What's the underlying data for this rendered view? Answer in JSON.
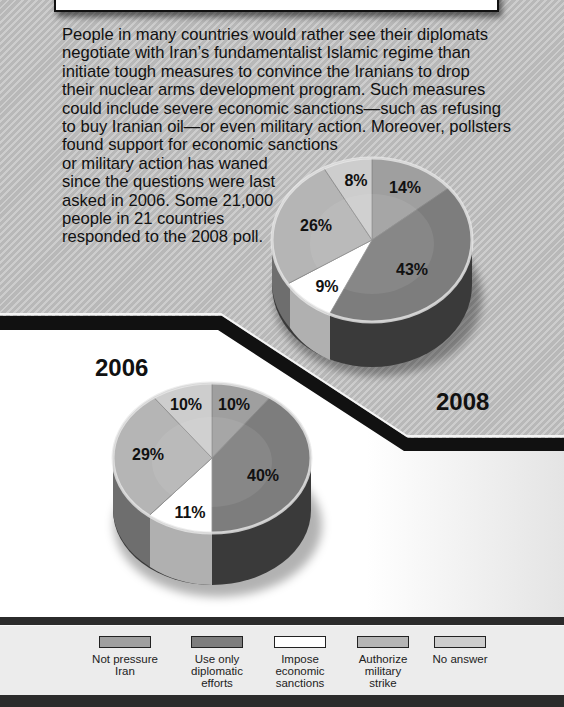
{
  "intro": {
    "lines": [
      "People in many countries would rather see their diplomats",
      "negotiate with Iran’s fundamentalist Islamic regime than",
      "initiate tough measures to convince the Iranians to drop",
      "their nuclear arms development program. Such measures",
      "could include severe economic sanctions—such as refusing",
      "to buy Iranian oil—or even military action. Moreover, pollsters",
      "found support for economic sanctions",
      "or military action has waned",
      "since the questions were last",
      "asked in 2006. Some 21,000",
      "people in 21 countries",
      "responded to the 2008 poll."
    ]
  },
  "years": {
    "y2006": "2006",
    "y2008": "2008"
  },
  "pie2008": {
    "labels": [
      "14%",
      "43%",
      "9%",
      "26%",
      "8%"
    ]
  },
  "pie2006": {
    "labels": [
      "10%",
      "40%",
      "11%",
      "29%",
      "10%"
    ]
  },
  "legend": {
    "items": [
      {
        "label_line1": "Not pressure",
        "label_line2": "Iran",
        "label_line3": "",
        "color": "#9f9f9f"
      },
      {
        "label_line1": "Use only",
        "label_line2": "diplomatic",
        "label_line3": "efforts",
        "color": "#7d7d7d"
      },
      {
        "label_line1": "Impose",
        "label_line2": "economic",
        "label_line3": "sanctions",
        "color": "#ffffff"
      },
      {
        "label_line1": "Authorize",
        "label_line2": "military",
        "label_line3": "strike",
        "color": "#b5b5b5"
      },
      {
        "label_line1": "No answer",
        "label_line2": "",
        "label_line3": "",
        "color": "#cdcdcd"
      }
    ]
  },
  "chart_data": [
    {
      "type": "pie",
      "title": "2008",
      "categories": [
        "Not pressure Iran",
        "Use only diplomatic efforts",
        "Impose economic sanctions",
        "Authorize military strike",
        "No answer"
      ],
      "values": [
        14,
        43,
        9,
        26,
        8
      ],
      "unit": "%",
      "colors": [
        "#9f9f9f",
        "#7d7d7d",
        "#ffffff",
        "#b5b5b5",
        "#cdcdcd"
      ],
      "legend_position": "bottom"
    },
    {
      "type": "pie",
      "title": "2006",
      "categories": [
        "Not pressure Iran",
        "Use only diplomatic efforts",
        "Impose economic sanctions",
        "Authorize military strike",
        "No answer"
      ],
      "values": [
        10,
        40,
        11,
        29,
        10
      ],
      "unit": "%",
      "colors": [
        "#9f9f9f",
        "#7d7d7d",
        "#ffffff",
        "#b5b5b5",
        "#cdcdcd"
      ],
      "legend_position": "bottom"
    }
  ]
}
